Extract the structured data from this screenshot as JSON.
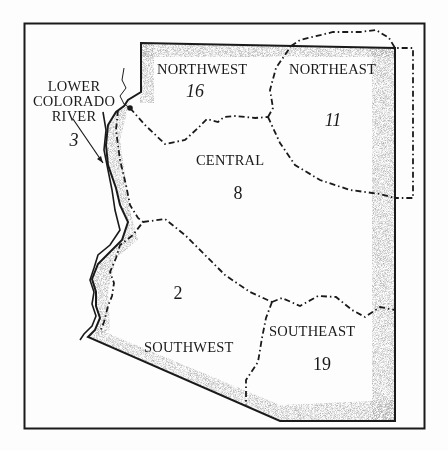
{
  "map": {
    "subject": "Arizona regions",
    "colors": {
      "ink": "#1a1a1a",
      "stipple": "#9a9a9a",
      "paper": "#fdfdfd"
    },
    "regions": [
      {
        "id": "northwest",
        "name": "NORTHWEST",
        "value": "16"
      },
      {
        "id": "northeast",
        "name": "NORTHEAST",
        "value": "11"
      },
      {
        "id": "central",
        "name": "CENTRAL",
        "value": "8"
      },
      {
        "id": "southwest",
        "name": "SOUTHWEST",
        "value": "2"
      },
      {
        "id": "southeast",
        "name": "SOUTHEAST",
        "value": "19"
      }
    ],
    "river_label": {
      "lines": [
        "LOWER",
        "COLORADO",
        "RIVER"
      ],
      "value": "3"
    }
  }
}
